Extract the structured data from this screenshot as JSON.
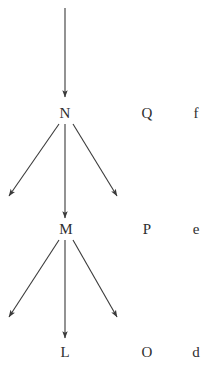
{
  "figure": {
    "width": 216,
    "height": 376,
    "background_color": "#ffffff",
    "stroke_color": "#3a3a3a",
    "text_color": "#2e2e2e"
  },
  "rows": [
    {
      "id": "row-n",
      "y": 113,
      "labels": [
        {
          "id": "label-n",
          "text": "N",
          "x": 65
        },
        {
          "id": "label-q",
          "text": "Q",
          "x": 147
        },
        {
          "id": "label-f",
          "text": "f",
          "x": 196
        }
      ]
    },
    {
      "id": "row-m",
      "y": 229,
      "labels": [
        {
          "id": "label-m",
          "text": "M",
          "x": 66
        },
        {
          "id": "label-p",
          "text": "P",
          "x": 147
        },
        {
          "id": "label-e",
          "text": "e",
          "x": 196
        }
      ]
    },
    {
      "id": "row-l",
      "y": 352,
      "labels": [
        {
          "id": "label-l",
          "text": "L",
          "x": 65
        },
        {
          "id": "label-o",
          "text": "O",
          "x": 147
        },
        {
          "id": "label-d",
          "text": "d",
          "x": 196
        }
      ]
    }
  ],
  "arrows": [
    {
      "id": "arrow-top-into-n",
      "name": "arrow-top-into-n",
      "from": {
        "x": 65,
        "y": 8
      },
      "to": {
        "x": 65,
        "y": 97
      }
    },
    {
      "id": "arrow-n-left",
      "name": "arrow-n-to-left",
      "from": {
        "x": 59,
        "y": 124
      },
      "to": {
        "x": 9,
        "y": 196
      }
    },
    {
      "id": "arrow-n-down",
      "name": "arrow-n-to-m",
      "from": {
        "x": 65,
        "y": 124
      },
      "to": {
        "x": 65,
        "y": 218
      }
    },
    {
      "id": "arrow-n-right",
      "name": "arrow-n-to-right",
      "from": {
        "x": 73,
        "y": 124
      },
      "to": {
        "x": 117,
        "y": 196
      }
    },
    {
      "id": "arrow-m-left",
      "name": "arrow-m-to-left",
      "from": {
        "x": 59,
        "y": 240
      },
      "to": {
        "x": 9,
        "y": 317
      }
    },
    {
      "id": "arrow-m-down",
      "name": "arrow-m-to-l",
      "from": {
        "x": 65,
        "y": 240
      },
      "to": {
        "x": 65,
        "y": 338
      }
    },
    {
      "id": "arrow-m-right",
      "name": "arrow-m-to-right",
      "from": {
        "x": 73,
        "y": 240
      },
      "to": {
        "x": 117,
        "y": 317
      }
    }
  ]
}
